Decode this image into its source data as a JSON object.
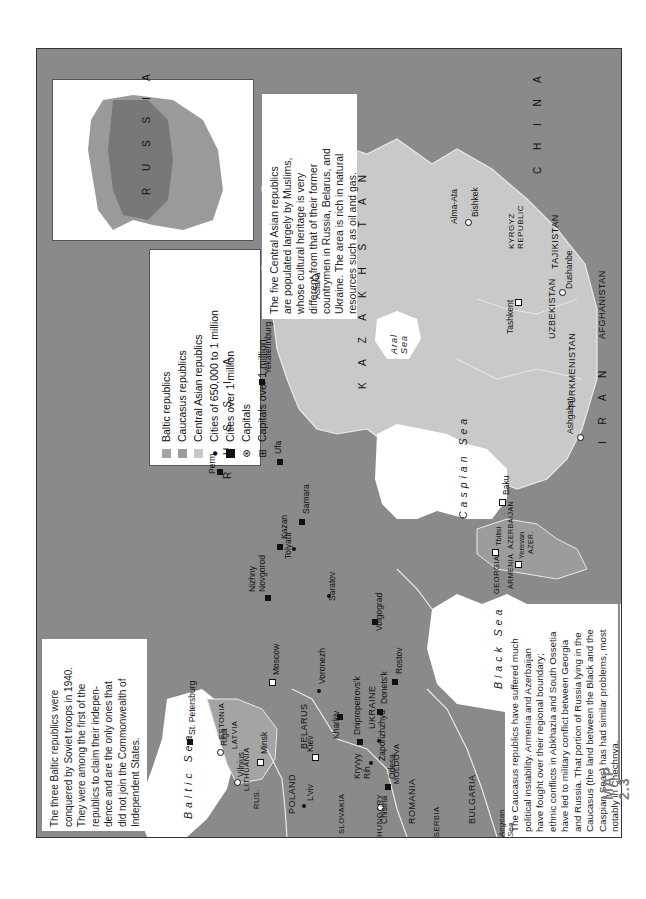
{
  "map": {
    "label": "MAP 2.3",
    "orientation": "rotated 90° counter-clockwise",
    "colors": {
      "russia_and_other": "#8a8a8a",
      "baltic": "#a4a4a4",
      "caucasus": "#9c9c9c",
      "central_asia": "#c9c9c9",
      "water": "#ffffff",
      "borders": "#e8e8e8"
    }
  },
  "inset": {
    "label": "R U S S I A"
  },
  "legend": {
    "items": [
      {
        "symbol": "swatch",
        "color": "#a4a4a4",
        "label": "Baltic republics"
      },
      {
        "symbol": "swatch",
        "color": "#9c9c9c",
        "label": "Caucasus republics"
      },
      {
        "symbol": "swatch",
        "color": "#c9c9c9",
        "label": "Central Asian republics"
      },
      {
        "symbol": "dot",
        "label": "Cities of 650,000 to 1 million"
      },
      {
        "symbol": "square",
        "label": "Cities over 1 million"
      },
      {
        "symbol": "capital-circle",
        "label": "Capitals"
      },
      {
        "symbol": "capital-square",
        "label": "Capitals over 1 million"
      }
    ]
  },
  "notes": {
    "central_asia": "The five Central Asian republics\nare populated largely by Muslims,\nwhose cultural heritage is very\ndifferent from that of their former\ncountrymen in Russia, Belarus, and\nUkraine. The area is rich in natural\nresources such as oil and gas.",
    "baltic": "The three Baltic republics were\nconquered by Soviet troops in 1940.\nThey were among the first of the\nrepublics to claim their indepen-\ndence and are the only ones that\ndid not join the Commonwealth of\nIndependent States.",
    "caucasus": "The Caucasus republics have suffered much\npolitical instability. Armenia and Azerbaijan\nhave fought over their regional boundary;\nethnic conflicts in Abkhazia and South Ossetia\nhave led to military conflict between Georgia\nand Russia. That portion of Russia lying in the\nCaucasus (the land between the Black and the\nCaspian Seas) has had similar problems, most\nnotably in Chechnya."
  },
  "countries": {
    "russia": "R U S S I A",
    "kazakhstan": "K A Z A K H S T A N",
    "china": "C H I N A",
    "iran": "I R A N",
    "afghanistan": "AFGHANISTAN",
    "uzbekistan": "UZBEKISTAN",
    "turkmenistan": "TURKMENISTAN",
    "tajikistan": "TAJIKISTAN",
    "kyrgyz": "KYRGYZ\nREPUBLIC",
    "ukraine": "UKRAINE",
    "belarus": "BELARUS",
    "poland": "POLAND",
    "lithuania": "LITHUANIA",
    "latvia": "LATVIA",
    "estonia": "ESTONIA",
    "rus": "RUS.",
    "moldova": "MOLDOVA",
    "romania": "ROMANIA",
    "bulgaria": "BULGARIA",
    "hungary": "HUNGARY",
    "slovakia": "SLOVAKIA",
    "serbia": "SERBIA",
    "georgia": "GEORGIA",
    "armenia": "ARMENIA",
    "azerbaijan": "AZERBAIJAN",
    "azer": "AZER."
  },
  "seas": {
    "baltic": "Baltic Sea",
    "black": "Black  Sea",
    "caspian": "Caspian  Sea",
    "aral": "Aral\nSea",
    "aegean": "Aegean\nSea"
  },
  "cities": [
    {
      "name": "St. Petersburg",
      "type": "over1m"
    },
    {
      "name": "Moscow",
      "type": "capital-over1m"
    },
    {
      "name": "Nizhny\nNovgorod",
      "type": "over1m"
    },
    {
      "name": "Kazan",
      "type": "over1m"
    },
    {
      "name": "Perm",
      "type": "over1m"
    },
    {
      "name": "Yekaterinburg",
      "type": "over1m"
    },
    {
      "name": "Ufa",
      "type": "over1m"
    },
    {
      "name": "Samara",
      "type": "over1m"
    },
    {
      "name": "Tolyatti",
      "type": "650k"
    },
    {
      "name": "Saratov",
      "type": "650k"
    },
    {
      "name": "Voronezh",
      "type": "650k"
    },
    {
      "name": "Volgograd",
      "type": "over1m"
    },
    {
      "name": "Rostov",
      "type": "over1m"
    },
    {
      "name": "Donets'k",
      "type": "over1m"
    },
    {
      "name": "Dnipropetrovs'k",
      "type": "over1m"
    },
    {
      "name": "Zaporizhzhya",
      "type": "650k"
    },
    {
      "name": "Kharkiv",
      "type": "over1m"
    },
    {
      "name": "Kryvyy\nRih",
      "type": "650k"
    },
    {
      "name": "Odesa",
      "type": "over1m"
    },
    {
      "name": "Kiev",
      "type": "capital-over1m"
    },
    {
      "name": "L'viv",
      "type": "650k"
    },
    {
      "name": "Minsk",
      "type": "capital-over1m"
    },
    {
      "name": "Vilnius",
      "type": "capital"
    },
    {
      "name": "Riga",
      "type": "capital"
    },
    {
      "name": "Chisina",
      "type": "capital"
    },
    {
      "name": "Tbilisi",
      "type": "capital-over1m"
    },
    {
      "name": "Yerevan",
      "type": "capital-over1m"
    },
    {
      "name": "Baku",
      "type": "capital-over1m"
    },
    {
      "name": "Astana",
      "type": "capital"
    },
    {
      "name": "Alma-Ata",
      "type": "none"
    },
    {
      "name": "Bishkek",
      "type": "capital"
    },
    {
      "name": "Tashkent",
      "type": "capital-over1m"
    },
    {
      "name": "Dushanbe",
      "type": "capital"
    },
    {
      "name": "Ashgabat",
      "type": "capital"
    }
  ]
}
